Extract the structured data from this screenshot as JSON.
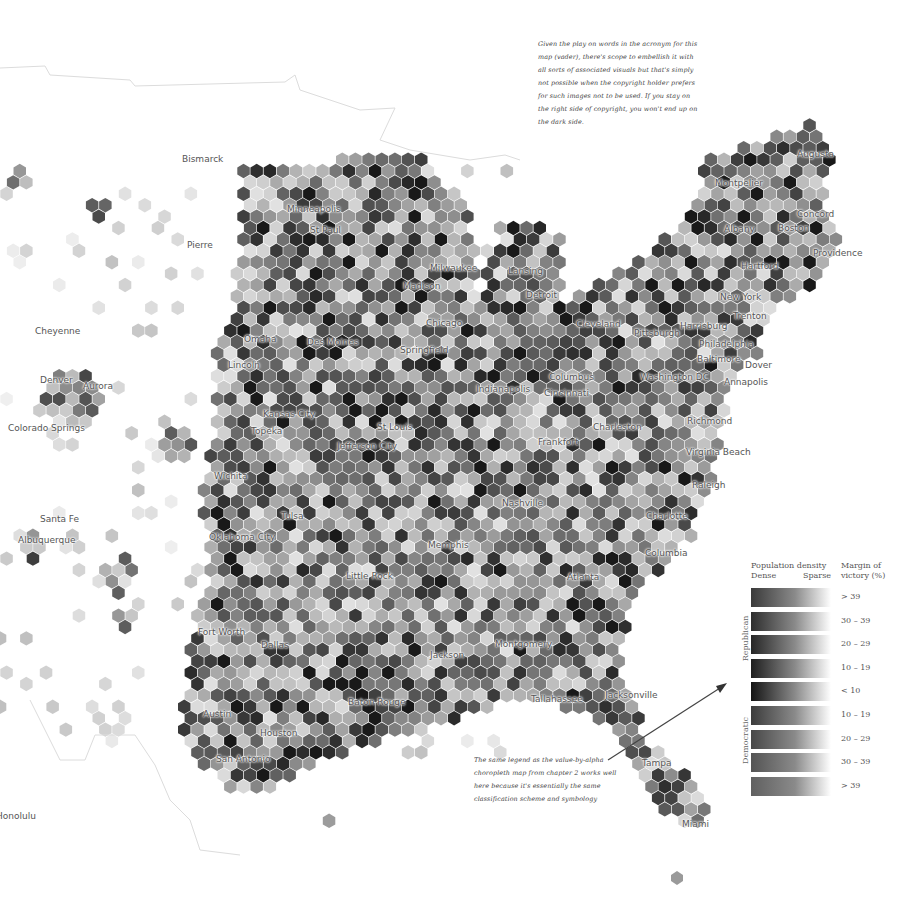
{
  "map": {
    "type": "hexbin bivariate choropleth",
    "subject": "US election margin of victory by population density",
    "background_color": "#ffffff",
    "hex_color_range": [
      "#f2f2f2",
      "#1a1a1a"
    ]
  },
  "cities": [
    {
      "name": "Bismarck",
      "x": 182,
      "y": 160
    },
    {
      "name": "Pierre",
      "x": 187,
      "y": 246
    },
    {
      "name": "Minneapolis",
      "x": 287,
      "y": 210
    },
    {
      "name": "St Paul",
      "x": 310,
      "y": 231
    },
    {
      "name": "Milwaukee",
      "x": 430,
      "y": 269
    },
    {
      "name": "Madison",
      "x": 403,
      "y": 287
    },
    {
      "name": "Lansing",
      "x": 508,
      "y": 272
    },
    {
      "name": "Detroit",
      "x": 526,
      "y": 296
    },
    {
      "name": "Chicago",
      "x": 426,
      "y": 324
    },
    {
      "name": "Cheyenne",
      "x": 35,
      "y": 332
    },
    {
      "name": "Omaha",
      "x": 244,
      "y": 340
    },
    {
      "name": "Des Moines",
      "x": 307,
      "y": 343
    },
    {
      "name": "Lincoln",
      "x": 228,
      "y": 366
    },
    {
      "name": "Denver",
      "x": 40,
      "y": 381
    },
    {
      "name": "Aurora",
      "x": 83,
      "y": 387
    },
    {
      "name": "Colorado Springs",
      "x": 8,
      "y": 429
    },
    {
      "name": "Springfield",
      "x": 400,
      "y": 351
    },
    {
      "name": "Indianapolis",
      "x": 476,
      "y": 390
    },
    {
      "name": "Cincinnati",
      "x": 544,
      "y": 394
    },
    {
      "name": "Columbus",
      "x": 549,
      "y": 378
    },
    {
      "name": "Cleveland",
      "x": 576,
      "y": 325
    },
    {
      "name": "Pittsburgh",
      "x": 634,
      "y": 334
    },
    {
      "name": "Harrisburg",
      "x": 680,
      "y": 327
    },
    {
      "name": "Philadelphia",
      "x": 699,
      "y": 345
    },
    {
      "name": "Baltimore",
      "x": 697,
      "y": 360
    },
    {
      "name": "Dover",
      "x": 745,
      "y": 366
    },
    {
      "name": "Annapolis",
      "x": 724,
      "y": 383
    },
    {
      "name": "Washington DC",
      "x": 640,
      "y": 378
    },
    {
      "name": "Trenton",
      "x": 733,
      "y": 317
    },
    {
      "name": "New York",
      "x": 720,
      "y": 298
    },
    {
      "name": "Hartford",
      "x": 741,
      "y": 267
    },
    {
      "name": "Albany",
      "x": 724,
      "y": 230
    },
    {
      "name": "Boston",
      "x": 778,
      "y": 229
    },
    {
      "name": "Concord",
      "x": 797,
      "y": 215
    },
    {
      "name": "Providence",
      "x": 813,
      "y": 254
    },
    {
      "name": "Montpelier",
      "x": 715,
      "y": 184
    },
    {
      "name": "Augusta",
      "x": 797,
      "y": 155
    },
    {
      "name": "Kansas City",
      "x": 263,
      "y": 415
    },
    {
      "name": "Topeka",
      "x": 251,
      "y": 432
    },
    {
      "name": "St Louis",
      "x": 377,
      "y": 428
    },
    {
      "name": "Jefferson City",
      "x": 337,
      "y": 447
    },
    {
      "name": "Charleston",
      "x": 593,
      "y": 428
    },
    {
      "name": "Frankfort",
      "x": 538,
      "y": 443
    },
    {
      "name": "Richmond",
      "x": 687,
      "y": 422
    },
    {
      "name": "Virginia Beach",
      "x": 686,
      "y": 453
    },
    {
      "name": "Wichita",
      "x": 214,
      "y": 477
    },
    {
      "name": "Tulsa",
      "x": 281,
      "y": 517
    },
    {
      "name": "Nashville",
      "x": 502,
      "y": 504
    },
    {
      "name": "Raleigh",
      "x": 692,
      "y": 486
    },
    {
      "name": "Charlotte",
      "x": 646,
      "y": 517
    },
    {
      "name": "Santa Fe",
      "x": 40,
      "y": 520
    },
    {
      "name": "Albuquerque",
      "x": 18,
      "y": 541
    },
    {
      "name": "Oklahoma City",
      "x": 209,
      "y": 538
    },
    {
      "name": "Memphis",
      "x": 428,
      "y": 546
    },
    {
      "name": "Columbia",
      "x": 645,
      "y": 554
    },
    {
      "name": "Little Rock",
      "x": 346,
      "y": 577
    },
    {
      "name": "Atlanta",
      "x": 567,
      "y": 578
    },
    {
      "name": "Fort Worth",
      "x": 198,
      "y": 633
    },
    {
      "name": "Dallas",
      "x": 261,
      "y": 646
    },
    {
      "name": "Jackson",
      "x": 430,
      "y": 656
    },
    {
      "name": "Montgomery",
      "x": 495,
      "y": 645
    },
    {
      "name": "Baton Rouge",
      "x": 348,
      "y": 703
    },
    {
      "name": "Tallahassee",
      "x": 531,
      "y": 700
    },
    {
      "name": "Jacksonville",
      "x": 605,
      "y": 696
    },
    {
      "name": "Austin",
      "x": 203,
      "y": 715
    },
    {
      "name": "Houston",
      "x": 260,
      "y": 734
    },
    {
      "name": "San Antonio",
      "x": 216,
      "y": 760
    },
    {
      "name": "Tampa",
      "x": 642,
      "y": 764
    },
    {
      "name": "Miami",
      "x": 682,
      "y": 825
    },
    {
      "name": "Honolulu",
      "x": -4,
      "y": 817
    }
  ],
  "annotations": {
    "top": "Given the play on words in the acronym for this map (vader), there's scope to embellish it with all sorts of associated visuals but that's simply not possible when the copyright holder prefers for such images not to be used. If you stay on the right side of copyright, you won't end up on the dark side.",
    "bottom": "The same legend as the value-by-alpha choropleth map from chapter 2 works well here because it's essentially the same classification scheme and symbology"
  },
  "legend": {
    "density_title": "Population density",
    "dense_label": "Dense",
    "sparse_label": "Sparse",
    "margin_title_line1": "Margin of",
    "margin_title_line2": "victory (%)",
    "republican_label": "Republican",
    "democratic_label": "Democratic",
    "rows": [
      {
        "label": "> 39",
        "party": "Republican",
        "dark": "#3a3a3a"
      },
      {
        "label": "30 – 39",
        "party": "Republican",
        "dark": "#2e2e2e"
      },
      {
        "label": "20 – 29",
        "party": "Republican",
        "dark": "#262626"
      },
      {
        "label": "10 – 19",
        "party": "Republican",
        "dark": "#1e1e1e"
      },
      {
        "label": "< 10",
        "party": "Tossup",
        "dark": "#141414"
      },
      {
        "label": "10 – 19",
        "party": "Democratic",
        "dark": "#3c3c3c"
      },
      {
        "label": "20 – 29",
        "party": "Democratic",
        "dark": "#484848"
      },
      {
        "label": "30 – 39",
        "party": "Democratic",
        "dark": "#545454"
      },
      {
        "label": "> 39",
        "party": "Democratic",
        "dark": "#606060"
      }
    ]
  }
}
